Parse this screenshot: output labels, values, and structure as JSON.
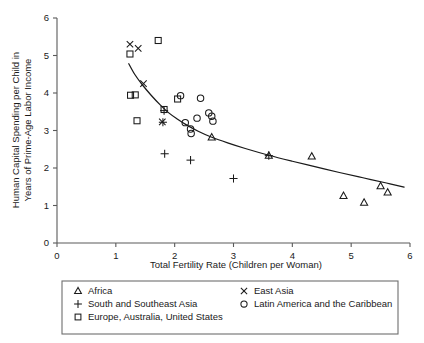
{
  "chart_data": {
    "type": "scatter",
    "title": "",
    "xlabel": "Total Fertility Rate (Children per Woman)",
    "ylabel": "Human Capital Spending per Child in Years of Prime-Age Labor Income",
    "xlim": [
      0,
      6
    ],
    "ylim": [
      0,
      6
    ],
    "xticks": [
      0,
      1,
      2,
      3,
      4,
      5,
      6
    ],
    "yticks": [
      0,
      1,
      2,
      3,
      4,
      5,
      6
    ],
    "xtick_labels": [
      "0",
      "1",
      "2",
      "3",
      "4",
      "5",
      "6"
    ],
    "ytick_labels": [
      "0",
      "1",
      "2",
      "3",
      "4",
      "5",
      "6"
    ],
    "grid": false,
    "legend_position": "below-plot",
    "series": [
      {
        "name": "Africa",
        "marker": "triangle",
        "points": [
          [
            2.63,
            2.82
          ],
          [
            3.6,
            2.33
          ],
          [
            4.33,
            2.31
          ],
          [
            4.87,
            1.26
          ],
          [
            5.22,
            1.08
          ],
          [
            5.5,
            1.52
          ],
          [
            5.62,
            1.35
          ]
        ]
      },
      {
        "name": "South and Southeast Asia",
        "marker": "plus",
        "points": [
          [
            1.8,
            3.22
          ],
          [
            1.82,
            3.53
          ],
          [
            1.83,
            2.38
          ],
          [
            2.27,
            2.21
          ],
          [
            3.0,
            1.72
          ],
          [
            3.6,
            2.33
          ]
        ]
      },
      {
        "name": "Europe, Australia, United States",
        "marker": "square",
        "points": [
          [
            1.24,
            5.04
          ],
          [
            1.25,
            3.94
          ],
          [
            1.33,
            3.95
          ],
          [
            1.36,
            3.26
          ],
          [
            1.72,
            5.4
          ],
          [
            1.82,
            3.56
          ],
          [
            2.05,
            3.84
          ]
        ]
      },
      {
        "name": "East Asia",
        "marker": "cross",
        "points": [
          [
            1.24,
            5.3
          ],
          [
            1.38,
            5.19
          ],
          [
            1.47,
            4.25
          ],
          [
            1.79,
            3.23
          ]
        ]
      },
      {
        "name": "Latin America and the Caribbean",
        "marker": "circle",
        "points": [
          [
            2.1,
            3.93
          ],
          [
            2.18,
            3.21
          ],
          [
            2.27,
            3.04
          ],
          [
            2.28,
            2.92
          ],
          [
            2.38,
            3.33
          ],
          [
            2.44,
            3.86
          ],
          [
            2.58,
            3.47
          ],
          [
            2.63,
            3.38
          ],
          [
            2.65,
            3.25
          ]
        ]
      }
    ],
    "fit_curve": {
      "name": "fitted trend",
      "points": [
        [
          1.22,
          4.78
        ],
        [
          1.32,
          4.5
        ],
        [
          1.45,
          4.22
        ],
        [
          1.6,
          3.94
        ],
        [
          1.75,
          3.69
        ],
        [
          1.9,
          3.47
        ],
        [
          2.05,
          3.3
        ],
        [
          2.2,
          3.15
        ],
        [
          2.4,
          2.98
        ],
        [
          2.6,
          2.84
        ],
        [
          2.9,
          2.67
        ],
        [
          3.2,
          2.52
        ],
        [
          3.6,
          2.34
        ],
        [
          4.0,
          2.18
        ],
        [
          4.4,
          2.03
        ],
        [
          4.8,
          1.88
        ],
        [
          5.2,
          1.74
        ],
        [
          5.6,
          1.6
        ],
        [
          5.9,
          1.49
        ]
      ]
    }
  },
  "legend": {
    "entries": [
      {
        "label": "Africa",
        "marker": "triangle"
      },
      {
        "label": "East Asia",
        "marker": "cross"
      },
      {
        "label": "South and Southeast Asia",
        "marker": "plus"
      },
      {
        "label": "Latin America and the Caribbean",
        "marker": "circle"
      },
      {
        "label": "Europe, Australia, United States",
        "marker": "square"
      }
    ]
  },
  "colors": {
    "ink": "#1a1a1a",
    "axis": "#5a5a5a",
    "legend_border": "#6e6e6e",
    "background": "#ffffff"
  }
}
